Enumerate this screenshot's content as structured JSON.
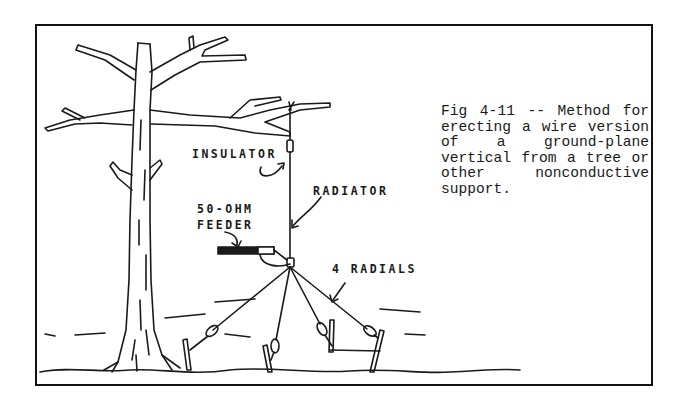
{
  "figure": {
    "caption": "Fig 4-11 -- Method for erecting a wire version of a ground-plane vertical from a tree or other nonconductive support.",
    "labels": {
      "insulator": "INSULATOR",
      "radiator": "RADIATOR",
      "feeder_line1": "50-OHM",
      "feeder_line2": "FEEDER",
      "radials": "4 RADIALS"
    },
    "colors": {
      "ink": "#1a1a1a",
      "paper": "#ffffff"
    }
  }
}
